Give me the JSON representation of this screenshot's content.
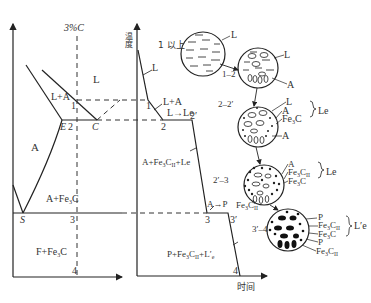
{
  "phase_diagram": {
    "composition_label": "3%C",
    "region_L": "L",
    "region_L_A": "L+A",
    "region_A": "A",
    "region_A_Fe3C": "A+Fe₃C",
    "region_F_Fe3C": "F+Fe₃C",
    "point_E": "E",
    "point_C": "C",
    "point_S": "S",
    "pt1": "1",
    "pt2": "2",
    "pt3": "3",
    "pt4": "4"
  },
  "cooling_curve": {
    "y_axis_label": "温度",
    "x_axis_label": "时间",
    "seg_L": "L",
    "seg_L_A": "L+A",
    "seg_L_Le": "L→Le",
    "seg_A_Fe3CII_Le": "A+Fe₃CII+Le",
    "seg_A_P": "A→P",
    "seg_P": "P+Fe₃CII+L′e",
    "pt1": "1",
    "pt2": "2",
    "pt2p": "2′",
    "pt3": "3",
    "pt3p": "3′",
    "pt4": "4"
  },
  "microstructures": [
    {
      "stage": "1 以上",
      "labels": [
        "L"
      ]
    },
    {
      "stage": "1–2",
      "labels": [
        "L",
        "A"
      ]
    },
    {
      "stage": "2–2′",
      "labels": [
        "L",
        "A",
        "Fe₃C",
        "A"
      ],
      "group": "Le"
    },
    {
      "stage": "2′–3",
      "labels": [
        "A",
        "Fe₃CII",
        "Fe₃C",
        "Fe₃CII"
      ],
      "group": "Le"
    },
    {
      "stage": "3′–4",
      "labels": [
        "P",
        "Fe₃CII",
        "Fe₃C",
        "P",
        "Fe₃CII"
      ],
      "group": "L′e"
    }
  ]
}
